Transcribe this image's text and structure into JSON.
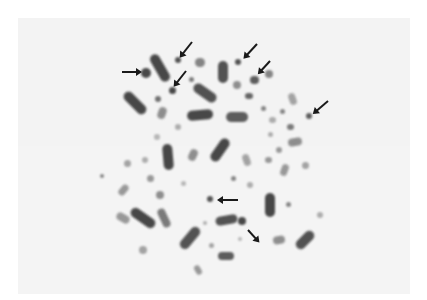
{
  "image": {
    "description": "Micrograph of a metaphase chromosome spread on a light gray background, with black arrows pointing to small dot-like chromosomes",
    "background_color": "#f3f3f3",
    "chromosome_color": "#2a2a2a",
    "arrow_color": "#1a1a1a",
    "arrow_count": 9
  },
  "chromosomes": [
    {
      "x": 160,
      "y": 68,
      "w": 10,
      "h": 30,
      "angle": -30,
      "o": 0.85
    },
    {
      "x": 146,
      "y": 73,
      "w": 10,
      "h": 10,
      "angle": 0,
      "o": 0.85
    },
    {
      "x": 178,
      "y": 60,
      "w": 6,
      "h": 6,
      "angle": 0,
      "o": 0.8
    },
    {
      "x": 172,
      "y": 90,
      "w": 7,
      "h": 7,
      "angle": 0,
      "o": 0.85
    },
    {
      "x": 191,
      "y": 79,
      "w": 5,
      "h": 5,
      "angle": 0,
      "o": 0.6
    },
    {
      "x": 200,
      "y": 62,
      "w": 10,
      "h": 9,
      "angle": 0,
      "o": 0.55
    },
    {
      "x": 135,
      "y": 103,
      "w": 10,
      "h": 28,
      "angle": -45,
      "o": 0.85
    },
    {
      "x": 158,
      "y": 99,
      "w": 6,
      "h": 6,
      "angle": 0,
      "o": 0.65
    },
    {
      "x": 205,
      "y": 93,
      "w": 10,
      "h": 26,
      "angle": -55,
      "o": 0.8
    },
    {
      "x": 162,
      "y": 113,
      "w": 8,
      "h": 12,
      "angle": 20,
      "o": 0.5
    },
    {
      "x": 178,
      "y": 127,
      "w": 6,
      "h": 6,
      "angle": 0,
      "o": 0.35
    },
    {
      "x": 157,
      "y": 137,
      "w": 6,
      "h": 6,
      "angle": 0,
      "o": 0.3
    },
    {
      "x": 200,
      "y": 115,
      "w": 10,
      "h": 26,
      "angle": 85,
      "o": 0.85
    },
    {
      "x": 223,
      "y": 72,
      "w": 10,
      "h": 22,
      "angle": 0,
      "o": 0.8
    },
    {
      "x": 238,
      "y": 62,
      "w": 6,
      "h": 6,
      "angle": 0,
      "o": 0.8
    },
    {
      "x": 237,
      "y": 85,
      "w": 8,
      "h": 8,
      "angle": 0,
      "o": 0.5
    },
    {
      "x": 254,
      "y": 80,
      "w": 9,
      "h": 8,
      "angle": 0,
      "o": 0.75
    },
    {
      "x": 269,
      "y": 74,
      "w": 8,
      "h": 8,
      "angle": 0,
      "o": 0.55
    },
    {
      "x": 249,
      "y": 96,
      "w": 8,
      "h": 6,
      "angle": 0,
      "o": 0.7
    },
    {
      "x": 237,
      "y": 117,
      "w": 10,
      "h": 22,
      "angle": 90,
      "o": 0.75
    },
    {
      "x": 263,
      "y": 108,
      "w": 5,
      "h": 5,
      "angle": 0,
      "o": 0.55
    },
    {
      "x": 282,
      "y": 111,
      "w": 5,
      "h": 5,
      "angle": 0,
      "o": 0.55
    },
    {
      "x": 292,
      "y": 99,
      "w": 7,
      "h": 12,
      "angle": -20,
      "o": 0.4
    },
    {
      "x": 309,
      "y": 116,
      "w": 6,
      "h": 6,
      "angle": 0,
      "o": 0.75
    },
    {
      "x": 290,
      "y": 127,
      "w": 7,
      "h": 6,
      "angle": 0,
      "o": 0.6
    },
    {
      "x": 272,
      "y": 120,
      "w": 7,
      "h": 6,
      "angle": 0,
      "o": 0.35
    },
    {
      "x": 270,
      "y": 134,
      "w": 5,
      "h": 5,
      "angle": 0,
      "o": 0.35
    },
    {
      "x": 295,
      "y": 142,
      "w": 8,
      "h": 14,
      "angle": 80,
      "o": 0.5
    },
    {
      "x": 279,
      "y": 150,
      "w": 6,
      "h": 6,
      "angle": 0,
      "o": 0.45
    },
    {
      "x": 168,
      "y": 157,
      "w": 10,
      "h": 26,
      "angle": -5,
      "o": 0.85
    },
    {
      "x": 220,
      "y": 150,
      "w": 10,
      "h": 26,
      "angle": 35,
      "o": 0.85
    },
    {
      "x": 193,
      "y": 155,
      "w": 8,
      "h": 12,
      "angle": 25,
      "o": 0.5
    },
    {
      "x": 145,
      "y": 160,
      "w": 6,
      "h": 6,
      "angle": 0,
      "o": 0.35
    },
    {
      "x": 127,
      "y": 163,
      "w": 7,
      "h": 7,
      "angle": 0,
      "o": 0.4
    },
    {
      "x": 246,
      "y": 160,
      "w": 7,
      "h": 12,
      "angle": -20,
      "o": 0.4
    },
    {
      "x": 268,
      "y": 160,
      "w": 7,
      "h": 6,
      "angle": 0,
      "o": 0.45
    },
    {
      "x": 284,
      "y": 170,
      "w": 7,
      "h": 12,
      "angle": 20,
      "o": 0.45
    },
    {
      "x": 305,
      "y": 165,
      "w": 7,
      "h": 7,
      "angle": 0,
      "o": 0.4
    },
    {
      "x": 150,
      "y": 178,
      "w": 7,
      "h": 7,
      "angle": 0,
      "o": 0.45
    },
    {
      "x": 123,
      "y": 190,
      "w": 7,
      "h": 12,
      "angle": 40,
      "o": 0.45
    },
    {
      "x": 102,
      "y": 176,
      "w": 4,
      "h": 4,
      "angle": 0,
      "o": 0.55
    },
    {
      "x": 160,
      "y": 195,
      "w": 8,
      "h": 8,
      "angle": 0,
      "o": 0.5
    },
    {
      "x": 183,
      "y": 183,
      "w": 5,
      "h": 5,
      "angle": 0,
      "o": 0.3
    },
    {
      "x": 210,
      "y": 199,
      "w": 6,
      "h": 6,
      "angle": 0,
      "o": 0.8
    },
    {
      "x": 233,
      "y": 178,
      "w": 5,
      "h": 5,
      "angle": 0,
      "o": 0.55
    },
    {
      "x": 250,
      "y": 185,
      "w": 6,
      "h": 6,
      "angle": 0,
      "o": 0.35
    },
    {
      "x": 270,
      "y": 205,
      "w": 10,
      "h": 24,
      "angle": 0,
      "o": 0.85
    },
    {
      "x": 288,
      "y": 204,
      "w": 5,
      "h": 5,
      "angle": 0,
      "o": 0.55
    },
    {
      "x": 320,
      "y": 215,
      "w": 6,
      "h": 6,
      "angle": 0,
      "o": 0.35
    },
    {
      "x": 143,
      "y": 218,
      "w": 10,
      "h": 28,
      "angle": -55,
      "o": 0.85
    },
    {
      "x": 164,
      "y": 218,
      "w": 8,
      "h": 20,
      "angle": -25,
      "o": 0.6
    },
    {
      "x": 226,
      "y": 220,
      "w": 9,
      "h": 22,
      "angle": 80,
      "o": 0.8
    },
    {
      "x": 242,
      "y": 221,
      "w": 8,
      "h": 8,
      "angle": 0,
      "o": 0.85
    },
    {
      "x": 190,
      "y": 238,
      "w": 10,
      "h": 26,
      "angle": 40,
      "o": 0.8
    },
    {
      "x": 205,
      "y": 223,
      "w": 4,
      "h": 4,
      "angle": 0,
      "o": 0.35
    },
    {
      "x": 211,
      "y": 245,
      "w": 5,
      "h": 5,
      "angle": 0,
      "o": 0.4
    },
    {
      "x": 240,
      "y": 239,
      "w": 4,
      "h": 4,
      "angle": 0,
      "o": 0.3
    },
    {
      "x": 279,
      "y": 240,
      "w": 8,
      "h": 12,
      "angle": 80,
      "o": 0.5
    },
    {
      "x": 305,
      "y": 240,
      "w": 10,
      "h": 22,
      "angle": 45,
      "o": 0.8
    },
    {
      "x": 226,
      "y": 256,
      "w": 8,
      "h": 16,
      "angle": 90,
      "o": 0.75
    },
    {
      "x": 143,
      "y": 250,
      "w": 8,
      "h": 8,
      "angle": 0,
      "o": 0.4
    },
    {
      "x": 198,
      "y": 270,
      "w": 6,
      "h": 10,
      "angle": -30,
      "o": 0.45
    },
    {
      "x": 123,
      "y": 218,
      "w": 8,
      "h": 14,
      "angle": -60,
      "o": 0.45
    }
  ],
  "arrows": [
    {
      "x1": 122,
      "y1": 71,
      "x2": 140,
      "y2": 71
    },
    {
      "x1": 192,
      "y1": 41,
      "x2": 181,
      "y2": 55
    },
    {
      "x1": 186,
      "y1": 70,
      "x2": 175,
      "y2": 84
    },
    {
      "x1": 257,
      "y1": 43,
      "x2": 245,
      "y2": 56
    },
    {
      "x1": 270,
      "y1": 60,
      "x2": 259,
      "y2": 72
    },
    {
      "x1": 328,
      "y1": 100,
      "x2": 314,
      "y2": 112
    },
    {
      "x1": 238,
      "y1": 199,
      "x2": 219,
      "y2": 199
    },
    {
      "x1": 248,
      "y1": 229,
      "x2": 258,
      "y2": 240
    },
    {
      "x1": 258,
      "y1": 240,
      "x2": 248,
      "y2": 229
    }
  ]
}
